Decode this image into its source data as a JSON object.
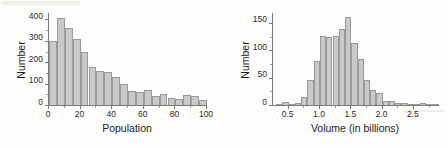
{
  "figures": [
    {
      "id": "population-histogram",
      "chart_data": {
        "type": "bar",
        "title": "",
        "xlabel": "Population",
        "ylabel": "Number",
        "xlim": [
          0,
          100
        ],
        "ylim": [
          0,
          430
        ],
        "xticks": [
          0,
          20,
          40,
          60,
          80,
          100
        ],
        "yticks": [
          0,
          100,
          200,
          300,
          400
        ],
        "grid": false,
        "legend": "none",
        "bin_width": 5,
        "bin_edges": [
          0,
          5,
          10,
          15,
          20,
          25,
          30,
          35,
          40,
          45,
          50,
          55,
          60,
          65,
          70,
          75,
          80,
          85,
          90,
          95,
          100
        ],
        "categories": [
          "0-5",
          "5-10",
          "10-15",
          "15-20",
          "20-25",
          "25-30",
          "30-35",
          "35-40",
          "40-45",
          "45-50",
          "50-55",
          "55-60",
          "60-65",
          "65-70",
          "70-75",
          "75-80",
          "80-85",
          "85-90",
          "90-95",
          "95-100"
        ],
        "values": [
          299,
          408,
          361,
          307,
          247,
          179,
          161,
          153,
          131,
          97,
          65,
          62,
          68,
          43,
          52,
          31,
          30,
          47,
          40,
          25
        ]
      }
    },
    {
      "id": "volume-histogram",
      "chart_data": {
        "type": "bar",
        "title": "",
        "xlabel": "Volume (in billions)",
        "ylabel": "Number",
        "xlim": [
          0.25,
          2.9
        ],
        "ylim": [
          0,
          168
        ],
        "xticks": [
          0.5,
          1.0,
          1.5,
          2.0,
          2.5
        ],
        "yticks": [
          0,
          50,
          100,
          150
        ],
        "grid": false,
        "legend": "none",
        "bin_width": 0.1,
        "bin_edges": [
          0.3,
          0.4,
          0.5,
          0.6,
          0.7,
          0.8,
          0.9,
          1.0,
          1.1,
          1.2,
          1.3,
          1.4,
          1.5,
          1.6,
          1.7,
          1.8,
          1.9,
          2.0,
          2.1,
          2.2,
          2.3,
          2.4,
          2.5,
          2.6,
          2.7,
          2.8,
          2.9
        ],
        "categories": [
          "0.3-0.4",
          "0.4-0.5",
          "0.5-0.6",
          "0.6-0.7",
          "0.7-0.8",
          "0.8-0.9",
          "0.9-1.0",
          "1.0-1.1",
          "1.1-1.2",
          "1.2-1.3",
          "1.3-1.4",
          "1.4-1.5",
          "1.5-1.6",
          "1.6-1.7",
          "1.7-1.8",
          "1.8-1.9",
          "1.9-2.0",
          "2.0-2.1",
          "2.1-2.2",
          "2.2-2.3",
          "2.3-2.4",
          "2.4-2.5",
          "2.5-2.6",
          "2.6-2.7",
          "2.7-2.8",
          "2.8-2.9"
        ],
        "values": [
          1,
          6,
          2,
          3,
          15,
          45,
          80,
          126,
          125,
          126,
          139,
          161,
          113,
          84,
          45,
          28,
          22,
          8,
          7,
          4,
          3,
          2,
          2,
          4,
          1,
          1
        ]
      }
    }
  ],
  "colors": {
    "bar_fill": "#c9c9c7",
    "bar_stroke": "#9a9a98",
    "axis": "#7a7a7a",
    "text": "#1c1c1c",
    "background": "#fdfdfc"
  }
}
